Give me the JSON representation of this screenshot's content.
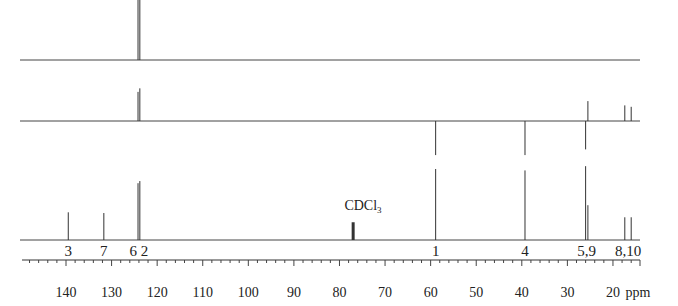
{
  "chart_data": {
    "type": "line",
    "title": "",
    "xlabel": "ppm",
    "ylabel": "",
    "xlim": [
      150,
      14
    ],
    "x_reversed": true,
    "grid": false,
    "legend": null,
    "x_ticks": [
      140,
      130,
      120,
      110,
      100,
      90,
      80,
      70,
      60,
      50,
      40,
      30,
      20
    ],
    "x_tick_labels": [
      "140",
      "130",
      "120",
      "110",
      "100",
      "90",
      "80",
      "70",
      "60",
      "50",
      "40",
      "30",
      "20"
    ],
    "minor_tick_step": 2,
    "axis_unit_label": "ppm",
    "series": [
      {
        "name": "DEPT-90 (top trace)",
        "baseline_y": 60,
        "peaks": [
          {
            "ppm": 124.2,
            "height": 0.89,
            "direction": "up"
          },
          {
            "ppm": 123.8,
            "height": 0.93,
            "direction": "up"
          }
        ]
      },
      {
        "name": "DEPT-135 (middle trace)",
        "baseline_y": 121,
        "peaks": [
          {
            "ppm": 124.2,
            "height": 0.41,
            "direction": "up"
          },
          {
            "ppm": 123.8,
            "height": 0.46,
            "direction": "up"
          },
          {
            "ppm": 58.9,
            "height": 0.48,
            "direction": "down"
          },
          {
            "ppm": 39.3,
            "height": 0.48,
            "direction": "down"
          },
          {
            "ppm": 26.0,
            "height": 0.4,
            "direction": "down"
          },
          {
            "ppm": 25.5,
            "height": 0.28,
            "direction": "up"
          },
          {
            "ppm": 17.4,
            "height": 0.22,
            "direction": "up"
          },
          {
            "ppm": 16.0,
            "height": 0.2,
            "direction": "up"
          }
        ]
      },
      {
        "name": "13C broadband (bottom trace)",
        "baseline_y": 240,
        "peaks": [
          {
            "ppm": 139.5,
            "height": 0.39,
            "label": "3"
          },
          {
            "ppm": 131.7,
            "height": 0.38,
            "label": "7"
          },
          {
            "ppm": 124.2,
            "height": 0.8,
            "label": "6"
          },
          {
            "ppm": 123.8,
            "height": 0.83,
            "label": "2"
          },
          {
            "ppm": 77.0,
            "height": 0.25,
            "label": "CDCl3",
            "bold": true
          },
          {
            "ppm": 58.9,
            "height": 1.0,
            "label": "1"
          },
          {
            "ppm": 39.3,
            "height": 0.98,
            "label": "4"
          },
          {
            "ppm": 26.0,
            "height": 1.04,
            "label": "5"
          },
          {
            "ppm": 25.5,
            "height": 0.49,
            "label": "9"
          },
          {
            "ppm": 17.4,
            "height": 0.32,
            "label": "8"
          },
          {
            "ppm": 16.0,
            "height": 0.32,
            "label": "10"
          }
        ]
      }
    ],
    "annotations": [
      {
        "text": "3",
        "ppm": 139.5
      },
      {
        "text": "7",
        "ppm": 131.7
      },
      {
        "text": "6 2",
        "ppm": 124.0
      },
      {
        "text": "CDCl3",
        "ppm": 77.0
      },
      {
        "text": "1",
        "ppm": 58.9
      },
      {
        "text": "4",
        "ppm": 39.3
      },
      {
        "text": "5,9",
        "ppm": 25.8
      },
      {
        "text": "8,10",
        "ppm": 16.7
      }
    ]
  },
  "labels": {
    "unit": "ppm",
    "solvent_main": "CDCl",
    "solvent_sub": "3"
  }
}
